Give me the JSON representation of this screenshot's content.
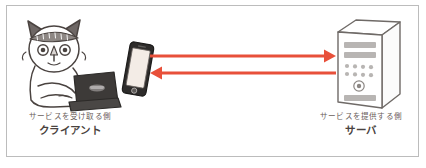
{
  "figure": {
    "background_color": "#ffffff",
    "border_color": "#bcbcbc"
  },
  "client": {
    "caption_top": "サービスを受け取る側",
    "caption_bold": "クライアント",
    "icons": {
      "cat": "cat-with-laptop-illustration",
      "laptop": "laptop-icon",
      "phone": "smartphone-icon"
    },
    "colors": {
      "outline": "#4a4340",
      "laptop_body": "#3d3a38",
      "cat_ear": "#6b6461"
    }
  },
  "server": {
    "caption_top": "サービスを提供する側",
    "caption_bold": "サーバ",
    "icons": {
      "tower": "server-tower-icon",
      "power_button": "power-button-icon"
    },
    "colors": {
      "outline": "#6f6a67",
      "panel_bar": "#b8b5b3",
      "dot": "#b8b5b3"
    },
    "drive_bays": 2,
    "dot_rows": 2,
    "dot_columns": 4
  },
  "arrows": {
    "color": "#e8503a",
    "request": {
      "name": "request-arrow",
      "direction": "client-to-server",
      "label": ""
    },
    "response": {
      "name": "response-arrow",
      "direction": "server-to-client",
      "label": ""
    }
  }
}
